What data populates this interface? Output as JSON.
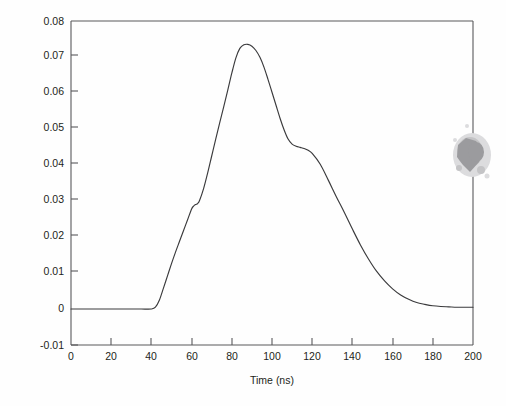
{
  "figure": {
    "background_color": "#fefefe",
    "axis_color": "#58585b",
    "curve_color": "#3a3a3c",
    "smudge_color": "#9b9b9e"
  },
  "chart_data": {
    "type": "line",
    "title": "",
    "subtitle": "",
    "xlabel": "Time (ns)",
    "ylabel": "",
    "xlim": [
      0,
      200
    ],
    "ylim": [
      -0.01,
      0.08
    ],
    "xticks": [
      0,
      20,
      40,
      60,
      80,
      100,
      120,
      140,
      160,
      180,
      200
    ],
    "xtick_labels": [
      "0",
      "20",
      "40",
      "60",
      "80",
      "100",
      "120",
      "140",
      "160",
      "180",
      "200"
    ],
    "yticks": [
      -0.01,
      0,
      0.01,
      0.02,
      0.03,
      0.04,
      0.05,
      0.06,
      0.07,
      0.08
    ],
    "ytick_labels": [
      "-0.01",
      "0",
      "0.01",
      "0.02",
      "0.03",
      "0.04",
      "0.05",
      "0.06",
      "0.07",
      "0.08"
    ],
    "grid": false,
    "legend": null,
    "legend_position": "none",
    "annotations": [],
    "series": [
      {
        "name": "pulse waveform",
        "color": "#3a3a3c",
        "x": [
          0,
          5,
          10,
          15,
          20,
          25,
          30,
          35,
          40,
          42,
          44,
          46,
          48,
          50,
          52,
          54,
          56,
          58,
          60,
          61,
          62,
          63,
          64,
          66,
          68,
          70,
          72,
          74,
          76,
          78,
          80,
          82,
          84,
          86,
          88,
          90,
          92,
          94,
          96,
          98,
          100,
          102,
          104,
          106,
          108,
          110,
          112,
          114,
          116,
          118,
          120,
          124,
          128,
          132,
          136,
          140,
          144,
          148,
          152,
          156,
          160,
          164,
          168,
          172,
          176,
          180,
          184,
          188,
          192,
          196,
          200
        ],
        "y": [
          0.0,
          0.0,
          0.0,
          0.0,
          0.0,
          0.0,
          0.0,
          0.0,
          0.0,
          0.0005,
          0.0025,
          0.0058,
          0.0092,
          0.0126,
          0.0158,
          0.0188,
          0.0218,
          0.0248,
          0.0278,
          0.0286,
          0.029,
          0.0293,
          0.0302,
          0.0335,
          0.0378,
          0.0425,
          0.0472,
          0.0518,
          0.0562,
          0.0608,
          0.0655,
          0.0697,
          0.0724,
          0.0734,
          0.0735,
          0.073,
          0.0718,
          0.0699,
          0.0672,
          0.0638,
          0.0602,
          0.0566,
          0.053,
          0.0498,
          0.0472,
          0.0458,
          0.0452,
          0.0449,
          0.0446,
          0.0441,
          0.0432,
          0.0402,
          0.0358,
          0.0312,
          0.0268,
          0.0222,
          0.0178,
          0.0139,
          0.0105,
          0.0078,
          0.0056,
          0.0039,
          0.0027,
          0.0018,
          0.0013,
          0.0009,
          0.0007,
          0.0006,
          0.0005,
          0.0005,
          0.0005
        ]
      }
    ],
    "features": {
      "onset_time": 42,
      "rising_shoulder_time": 62,
      "rising_shoulder_value": 0.029,
      "peak_time": 88,
      "peak_value": 0.0735,
      "falling_shoulder_time": 114,
      "falling_shoulder_value": 0.0449,
      "baseline_value": 0.0,
      "tail_value": 0.0005
    }
  },
  "artifacts": {
    "scan_smudge": {
      "name": "scan-smudge",
      "description": "gray ink smudge near right axis"
    }
  }
}
